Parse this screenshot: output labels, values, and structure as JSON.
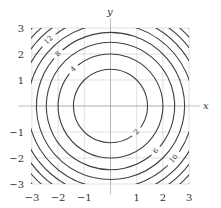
{
  "chart_data": {
    "type": "contour",
    "function": "x^2 + y^2",
    "xlabel": "x",
    "ylabel": "y",
    "xlim": [
      -3,
      3
    ],
    "ylim": [
      -3,
      3
    ],
    "grid": true,
    "axes": "centered-lines",
    "xticks": [
      -3,
      -2,
      -1,
      1,
      2,
      3
    ],
    "yticks": [
      3,
      2,
      1,
      -1,
      -2,
      -3
    ],
    "xtick_labels": [
      "−3",
      "−2",
      "−1",
      "1",
      "2",
      "3"
    ],
    "ytick_labels": [
      "3",
      "2",
      "1",
      "−1",
      "−2",
      "−3"
    ],
    "levels": [
      2,
      4,
      6,
      8,
      10,
      12,
      14,
      16,
      18
    ],
    "contour_labels": [
      {
        "text": "2",
        "level": 2,
        "angle_deg": -45
      },
      {
        "text": "4",
        "level": 4,
        "angle_deg": 135
      },
      {
        "text": "6",
        "level": 6,
        "angle_deg": -45
      },
      {
        "text": "8",
        "level": 8,
        "angle_deg": 135
      },
      {
        "text": "10",
        "level": 10,
        "angle_deg": -40
      },
      {
        "text": "12",
        "level": 12,
        "angle_deg": 133
      }
    ],
    "line_color": "#404040",
    "grid_color": "#cccccc"
  }
}
